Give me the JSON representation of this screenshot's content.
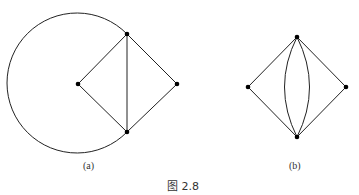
{
  "figure": {
    "caption": "图 2.8",
    "subfigures": [
      {
        "label": "(a)",
        "nodes": [
          "left",
          "top",
          "right",
          "bottom"
        ],
        "edges": [
          [
            "left",
            "top"
          ],
          [
            "left",
            "bottom"
          ],
          [
            "top",
            "right"
          ],
          [
            "bottom",
            "right"
          ],
          [
            "top",
            "bottom"
          ],
          [
            "top",
            "bottom",
            "arc"
          ]
        ]
      },
      {
        "label": "(b)",
        "nodes": [
          "left",
          "top",
          "right",
          "bottom"
        ],
        "edges": [
          [
            "left",
            "top"
          ],
          [
            "left",
            "bottom"
          ],
          [
            "top",
            "right"
          ],
          [
            "bottom",
            "right"
          ],
          [
            "top",
            "bottom",
            "curve-left"
          ],
          [
            "top",
            "bottom",
            "curve-right"
          ]
        ]
      }
    ]
  }
}
